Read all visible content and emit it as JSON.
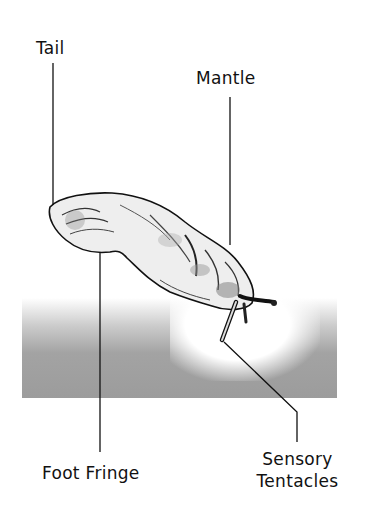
{
  "diagram": {
    "labels": {
      "tail": "Tail",
      "mantle": "Mantle",
      "foot_fringe": "Foot Fringe",
      "sensory_tentacles_line1": "Sensory",
      "sensory_tentacles_line2": "Tentacles"
    },
    "colors": {
      "ink": "#111111",
      "ground": "#9e9e9e",
      "background": "#ffffff"
    }
  }
}
